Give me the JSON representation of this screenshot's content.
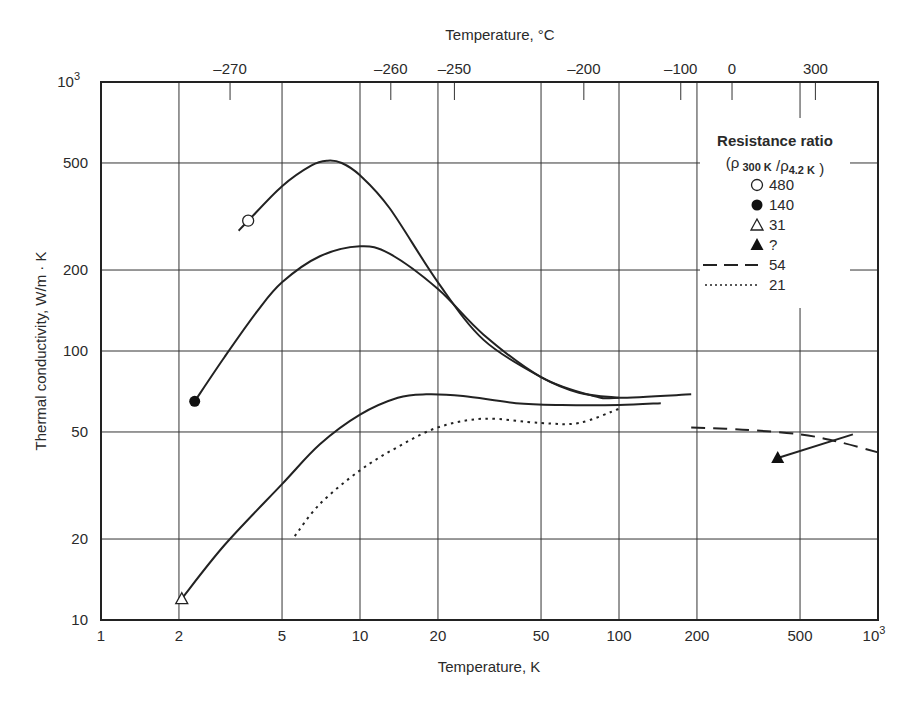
{
  "chart_data": {
    "type": "line",
    "title": "",
    "xlabel": "Temperature, K",
    "ylabel": "Thermal conductivity, W/m · K",
    "x2label": "Temperature, °C",
    "xscale": "log",
    "yscale": "log",
    "xlim": [
      1,
      1000
    ],
    "ylim": [
      10,
      1000
    ],
    "grid": true,
    "x_ticks": [
      1,
      2,
      5,
      10,
      20,
      50,
      100,
      200,
      500,
      1000
    ],
    "x_tick_labels": [
      "1",
      "2",
      "5",
      "10",
      "20",
      "50",
      "100",
      "200",
      "500",
      "10^3"
    ],
    "y_ticks": [
      10,
      20,
      50,
      100,
      200,
      500,
      1000
    ],
    "y_tick_labels": [
      "10",
      "20",
      "50",
      "100",
      "200",
      "500",
      "10^3"
    ],
    "x2_ticks_celsius": [
      -270,
      -260,
      -250,
      -200,
      -100,
      0,
      300
    ],
    "x2_tick_labels": [
      "–270",
      "–260",
      "–250",
      "–200",
      "–100",
      "0",
      "300"
    ],
    "legend": {
      "title": "Resistance ratio",
      "subtitle": "(ρ 300 K /ρ 4.2 K )",
      "position": "upper right",
      "entries": [
        {
          "marker": "open-circle",
          "label": "480"
        },
        {
          "marker": "filled-circle",
          "label": "140"
        },
        {
          "marker": "open-triangle",
          "label": "31"
        },
        {
          "marker": "filled-triangle",
          "label": "?"
        },
        {
          "line": "dashed",
          "label": "54"
        },
        {
          "line": "dotted",
          "label": "21"
        }
      ]
    },
    "series": [
      {
        "name": "480",
        "style": "solid",
        "marker": "open-circle",
        "marker_at": [
          3.7,
          305
        ],
        "x": [
          3.4,
          3.7,
          5,
          6.5,
          7.5,
          8.5,
          10,
          13,
          20,
          30,
          50,
          70,
          100
        ],
        "y": [
          280,
          305,
          410,
          490,
          510,
          500,
          450,
          340,
          180,
          110,
          80,
          70,
          67
        ]
      },
      {
        "name": "140",
        "style": "solid",
        "marker": "filled-circle",
        "marker_at": [
          2.3,
          65
        ],
        "x": [
          2.3,
          3,
          4,
          5,
          7,
          10,
          13,
          20,
          30,
          50,
          80,
          100,
          190
        ],
        "y": [
          65,
          95,
          140,
          180,
          225,
          245,
          230,
          170,
          115,
          80,
          68,
          67,
          69
        ]
      },
      {
        "name": "31",
        "style": "solid",
        "marker": "open-triangle",
        "marker_at": [
          2.05,
          12
        ],
        "x": [
          2.05,
          3,
          5,
          7,
          10,
          14,
          18,
          25,
          40,
          60,
          100,
          145
        ],
        "y": [
          12,
          19,
          32,
          45,
          58,
          67,
          69,
          68,
          64,
          63,
          63,
          64
        ]
      },
      {
        "name": "21",
        "style": "dotted",
        "marker": "none",
        "x": [
          5.6,
          7,
          10,
          14,
          20,
          30,
          50,
          70,
          100
        ],
        "y": [
          20.5,
          27,
          36,
          44,
          52,
          56,
          54,
          54,
          61
        ]
      },
      {
        "name": "54",
        "style": "dashed",
        "marker": "none",
        "x": [
          190,
          300,
          500,
          700,
          1000
        ],
        "y": [
          52,
          51,
          49,
          46,
          42
        ]
      },
      {
        "name": "?",
        "style": "solid",
        "marker": "filled-triangle",
        "marker_at": [
          410,
          40
        ],
        "x": [
          410,
          800
        ],
        "y": [
          40,
          49
        ]
      }
    ]
  }
}
